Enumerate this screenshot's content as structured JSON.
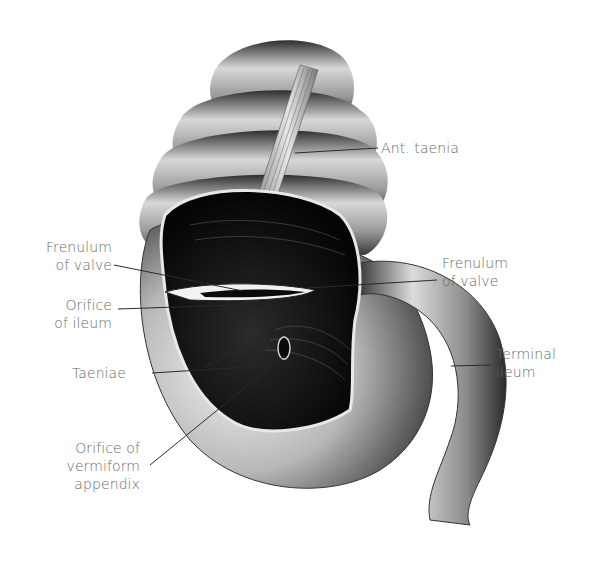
{
  "figure": {
    "colors": {
      "background": "#ffffff",
      "label_text": "#6a6a6a",
      "leader_line": "#2a2a2a"
    }
  },
  "labels": {
    "ant_taenia": {
      "lines": [
        "Ant. taenia"
      ]
    },
    "frenulum_left": {
      "lines": [
        "Frenulum",
        "of valve"
      ]
    },
    "frenulum_right": {
      "lines": [
        "Frenulum",
        "of valve"
      ]
    },
    "orifice_ileum": {
      "lines": [
        "Orifice",
        "of ileum"
      ]
    },
    "terminal_ileum": {
      "lines": [
        "Terminal",
        "ileum"
      ]
    },
    "taeniae": {
      "lines": [
        "Taeniae"
      ]
    },
    "orifice_appendix": {
      "lines": [
        "Orifice of",
        "vermiform",
        "appendix"
      ]
    }
  }
}
